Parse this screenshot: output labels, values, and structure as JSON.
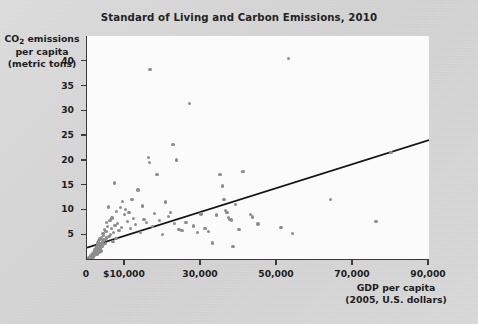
{
  "figure": {
    "background_color": "#d6d6d6",
    "plot_background_color": "#fbfbfb",
    "axis_color": "#3a3a3a",
    "point_color": "#8d8d8d",
    "trendline_color": "#151515"
  },
  "chart_data": {
    "type": "scatter",
    "title": "Standard of Living and Carbon Emissions, 2010",
    "xlabel_line1": "GDP per capita",
    "xlabel_line2": "(2005, U.S. dollars)",
    "ylabel_line1": "CO₂ emissions",
    "ylabel_line2": "per capita",
    "ylabel_line3": "(metric tons)",
    "xlim": [
      0,
      90000
    ],
    "ylim": [
      0,
      45
    ],
    "grid": false,
    "legend": null,
    "xticks": [
      0,
      10000,
      30000,
      50000,
      70000,
      90000
    ],
    "xtick_labels": [
      "0",
      "$10,000",
      "30,000",
      "50,000",
      "70,000",
      "90,000"
    ],
    "yticks": [
      5,
      10,
      15,
      20,
      25,
      30,
      35,
      40
    ],
    "ytick_labels": [
      "5",
      "10",
      "15",
      "20",
      "25",
      "30",
      "35",
      "40"
    ],
    "trendline": {
      "label": "linear fit",
      "x": [
        0,
        90000
      ],
      "y": [
        2.3,
        24.0
      ]
    },
    "points": [
      [
        500,
        0.2
      ],
      [
        700,
        0.3
      ],
      [
        800,
        0.1
      ],
      [
        900,
        0.4
      ],
      [
        1000,
        0.3
      ],
      [
        1100,
        0.6
      ],
      [
        1200,
        0.2
      ],
      [
        1300,
        0.8
      ],
      [
        1400,
        0.5
      ],
      [
        1500,
        1.0
      ],
      [
        1600,
        0.4
      ],
      [
        1700,
        1.2
      ],
      [
        1800,
        0.7
      ],
      [
        1900,
        1.5
      ],
      [
        2000,
        0.9
      ],
      [
        2100,
        1.8
      ],
      [
        2200,
        1.1
      ],
      [
        2300,
        2.1
      ],
      [
        2400,
        1.4
      ],
      [
        2500,
        2.4
      ],
      [
        2600,
        1.0
      ],
      [
        2700,
        2.8
      ],
      [
        2800,
        1.7
      ],
      [
        2900,
        3.2
      ],
      [
        3000,
        2.0
      ],
      [
        3100,
        3.6
      ],
      [
        3200,
        1.3
      ],
      [
        3300,
        2.6
      ],
      [
        3400,
        4.0
      ],
      [
        3500,
        2.2
      ],
      [
        3600,
        3.0
      ],
      [
        3700,
        1.6
      ],
      [
        3800,
        4.4
      ],
      [
        3900,
        2.5
      ],
      [
        4000,
        3.4
      ],
      [
        4200,
        5.2
      ],
      [
        4300,
        2.9
      ],
      [
        4400,
        4.8
      ],
      [
        4500,
        3.8
      ],
      [
        4600,
        6.0
      ],
      [
        4800,
        3.1
      ],
      [
        5000,
        5.6
      ],
      [
        5100,
        7.4
      ],
      [
        5200,
        4.2
      ],
      [
        5400,
        6.6
      ],
      [
        5600,
        10.5
      ],
      [
        5800,
        4.6
      ],
      [
        6000,
        7.8
      ],
      [
        6200,
        5.0
      ],
      [
        6400,
        6.2
      ],
      [
        6600,
        8.3
      ],
      [
        6800,
        3.5
      ],
      [
        7000,
        5.4
      ],
      [
        7200,
        15.3
      ],
      [
        7400,
        6.8
      ],
      [
        7600,
        4.1
      ],
      [
        7800,
        9.6
      ],
      [
        8000,
        7.2
      ],
      [
        8400,
        5.8
      ],
      [
        8800,
        10.4
      ],
      [
        9000,
        6.4
      ],
      [
        9400,
        11.6
      ],
      [
        9800,
        9.0
      ],
      [
        10200,
        10.0
      ],
      [
        10600,
        7.6
      ],
      [
        11000,
        9.4
      ],
      [
        11400,
        6.1
      ],
      [
        11800,
        12.0
      ],
      [
        12300,
        8.2
      ],
      [
        12800,
        7.0
      ],
      [
        13400,
        13.9
      ],
      [
        14000,
        5.3
      ],
      [
        14600,
        10.7
      ],
      [
        15000,
        8.0
      ],
      [
        15600,
        7.4
      ],
      [
        16200,
        20.5
      ],
      [
        16400,
        19.5
      ],
      [
        16600,
        38.3
      ],
      [
        17200,
        6.6
      ],
      [
        17800,
        9.2
      ],
      [
        18400,
        17.1
      ],
      [
        19000,
        7.8
      ],
      [
        19800,
        5.0
      ],
      [
        20600,
        11.5
      ],
      [
        21400,
        8.6
      ],
      [
        22000,
        9.4
      ],
      [
        22600,
        23.1
      ],
      [
        23000,
        7.2
      ],
      [
        23600,
        20.0
      ],
      [
        24200,
        6.0
      ],
      [
        25000,
        5.8
      ],
      [
        26000,
        7.4
      ],
      [
        27000,
        31.4
      ],
      [
        28000,
        6.7
      ],
      [
        29000,
        5.4
      ],
      [
        30000,
        9.1
      ],
      [
        31000,
        6.2
      ],
      [
        32000,
        5.6
      ],
      [
        33000,
        3.2
      ],
      [
        34000,
        8.9
      ],
      [
        35000,
        17.0
      ],
      [
        35600,
        14.7
      ],
      [
        36000,
        12.0
      ],
      [
        36400,
        9.8
      ],
      [
        36800,
        9.4
      ],
      [
        37200,
        8.4
      ],
      [
        37600,
        8.0
      ],
      [
        38000,
        7.9
      ],
      [
        38400,
        2.5
      ],
      [
        39000,
        11.0
      ],
      [
        40000,
        5.9
      ],
      [
        41000,
        17.7
      ],
      [
        43000,
        9.0
      ],
      [
        43600,
        8.5
      ],
      [
        45000,
        7.1
      ],
      [
        51000,
        6.4
      ],
      [
        53000,
        40.5
      ],
      [
        54000,
        5.2
      ],
      [
        64000,
        12.0
      ],
      [
        76000,
        7.6
      ],
      [
        80000,
        21.5
      ]
    ]
  }
}
